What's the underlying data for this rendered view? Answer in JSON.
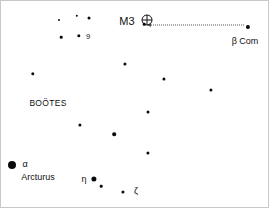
{
  "chart": {
    "type": "star-chart",
    "title": "",
    "width": 269,
    "height": 208,
    "background_color": "#ffffff",
    "border_color": "#c8c8c8",
    "star_color": "#0a0a0a",
    "text_color": "#111111",
    "pointer_color": "#555555"
  },
  "labels": {
    "constellation": "BOÖTES",
    "object": "M3",
    "object_symbol": "globular-cluster-symbol",
    "beta_com": "β Com",
    "alpha": "α",
    "arcturus": "Arcturus",
    "eta": "η",
    "zeta": "ζ",
    "nine": "9"
  },
  "stars": [
    {
      "name": "star-upper-small-1",
      "x": 58,
      "y": 19,
      "size": 2.0,
      "magnitude_class": "faint"
    },
    {
      "name": "star-upper-small-2",
      "x": 76,
      "y": 15,
      "size": 2.4,
      "magnitude_class": "faint"
    },
    {
      "name": "star-upper-small-3",
      "x": 88,
      "y": 17,
      "size": 3.0,
      "magnitude_class": "moderate"
    },
    {
      "name": "star-upper-small-4",
      "x": 60,
      "y": 36,
      "size": 2.6,
      "magnitude_class": "faint"
    },
    {
      "name": "star-9-boo",
      "x": 78,
      "y": 35,
      "size": 3.4,
      "magnitude_class": "moderate"
    },
    {
      "name": "star-m3-marker",
      "x": 143,
      "y": 23,
      "size": 2.6,
      "magnitude_class": "faint"
    },
    {
      "name": "star-beta-com",
      "x": 247,
      "y": 26,
      "size": 4.2,
      "magnitude_class": "bright"
    },
    {
      "name": "star-mid-1",
      "x": 124,
      "y": 63,
      "size": 3.2,
      "magnitude_class": "moderate"
    },
    {
      "name": "star-left-1",
      "x": 32,
      "y": 73,
      "size": 3.4,
      "magnitude_class": "moderate"
    },
    {
      "name": "star-mid-2",
      "x": 163,
      "y": 78,
      "size": 3.2,
      "magnitude_class": "moderate"
    },
    {
      "name": "star-right-1",
      "x": 210,
      "y": 89,
      "size": 3.2,
      "magnitude_class": "moderate"
    },
    {
      "name": "star-mid-3",
      "x": 147,
      "y": 111,
      "size": 3.0,
      "magnitude_class": "moderate"
    },
    {
      "name": "star-mid-4",
      "x": 79,
      "y": 124,
      "size": 3.2,
      "magnitude_class": "moderate"
    },
    {
      "name": "star-mid-5",
      "x": 113,
      "y": 133,
      "size": 3.6,
      "magnitude_class": "moderate"
    },
    {
      "name": "star-mid-6",
      "x": 147,
      "y": 152,
      "size": 3.2,
      "magnitude_class": "moderate"
    },
    {
      "name": "star-arcturus",
      "x": 11,
      "y": 164,
      "size": 8.0,
      "magnitude_class": "brightest"
    },
    {
      "name": "star-eta-boo",
      "x": 93,
      "y": 178,
      "size": 5.2,
      "magnitude_class": "bright"
    },
    {
      "name": "star-below-eta",
      "x": 100,
      "y": 185,
      "size": 2.6,
      "magnitude_class": "faint"
    },
    {
      "name": "star-zeta-boo",
      "x": 122,
      "y": 191,
      "size": 3.2,
      "magnitude_class": "moderate"
    }
  ],
  "text_positions": {
    "constellation": {
      "x": 47,
      "y": 102
    },
    "object": {
      "x": 126,
      "y": 20
    },
    "beta_com": {
      "x": 244,
      "y": 40
    },
    "alpha": {
      "x": 24,
      "y": 163
    },
    "arcturus": {
      "x": 37,
      "y": 176
    },
    "eta": {
      "x": 83,
      "y": 178
    },
    "zeta": {
      "x": 135,
      "y": 190
    },
    "nine": {
      "x": 87,
      "y": 36
    }
  },
  "cluster_symbol": {
    "x": 146,
    "y": 19,
    "radius": 5
  },
  "pointer": {
    "name": "m3-to-beta-com-pointer",
    "x_start": 150,
    "x_end": 243,
    "y": 24,
    "style": "dotted",
    "arrow_direction": "left"
  }
}
